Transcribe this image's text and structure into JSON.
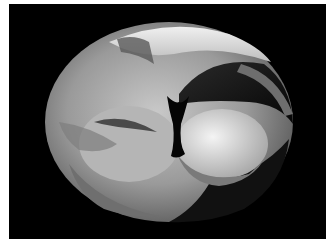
{
  "image": {
    "description": "Grayscale 3D rendered mathematical surface (self-intersecting toroidal surface) on black background",
    "background_color": "#000000",
    "border_color": "#ffffff",
    "palette": [
      "#0a0a0a",
      "#3a3a3a",
      "#6a6a6a",
      "#8e8e8e",
      "#a8a8a8",
      "#c4c4c4",
      "#e0e0e0",
      "#f2f2f2"
    ]
  }
}
